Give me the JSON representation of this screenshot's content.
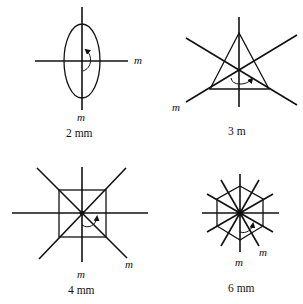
{
  "figure": {
    "panels": [
      {
        "id": "2mm",
        "caption": "2 mm",
        "mirror_labels": [
          "m",
          "m"
        ],
        "shape": "ellipse",
        "rotation_order": 2
      },
      {
        "id": "3m",
        "caption": "3 m",
        "mirror_labels": [
          "m"
        ],
        "shape": "triangle",
        "rotation_order": 3
      },
      {
        "id": "4mm",
        "caption": "4 mm",
        "mirror_labels": [
          "m",
          "m"
        ],
        "shape": "square",
        "rotation_order": 4
      },
      {
        "id": "6mm",
        "caption": "6 mm",
        "mirror_labels": [
          "m",
          "m"
        ],
        "shape": "hexagon",
        "rotation_order": 6
      }
    ],
    "colors": {
      "line": "#111111",
      "background": "#ffffff"
    }
  }
}
